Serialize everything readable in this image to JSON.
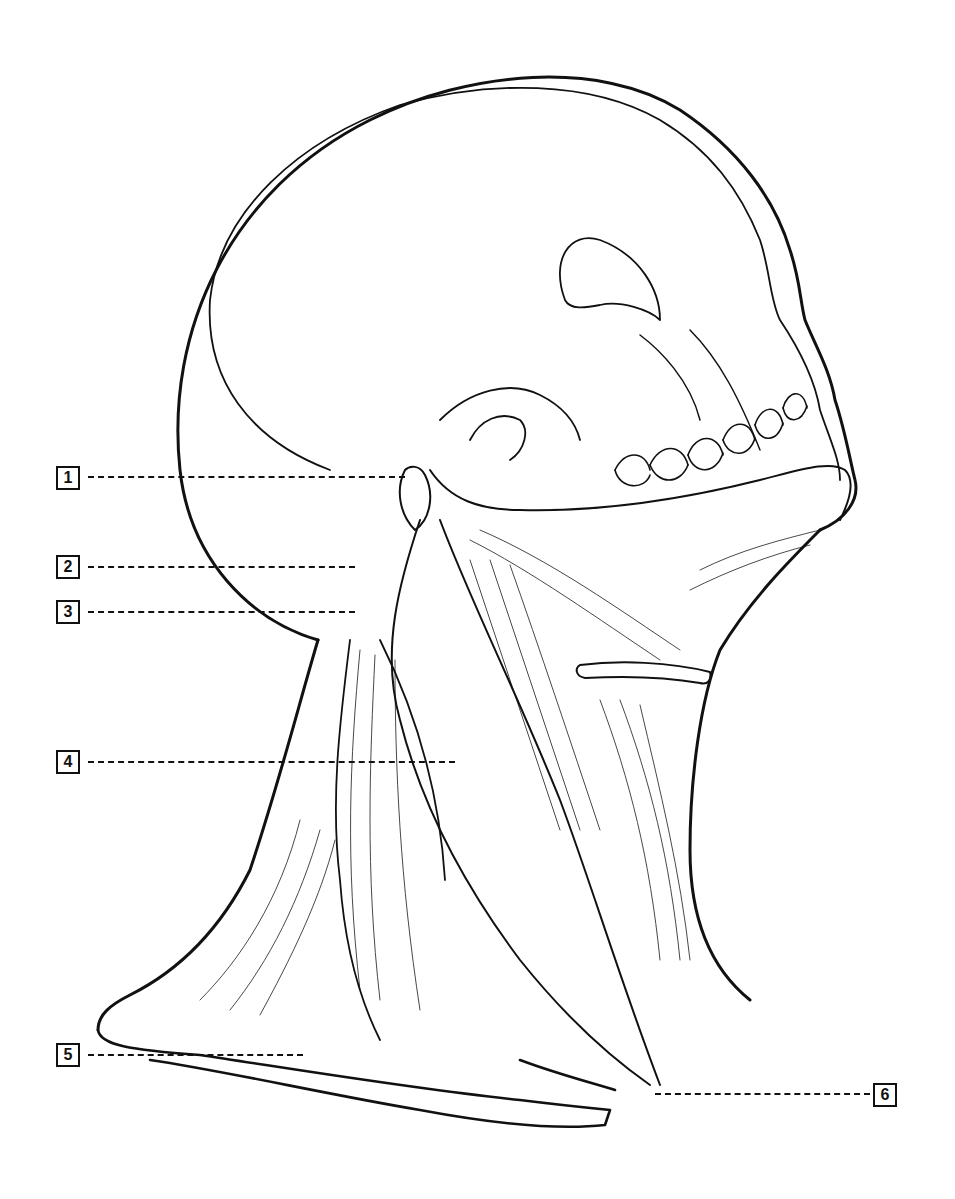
{
  "diagram": {
    "labels": [
      {
        "id": "1",
        "text": "1",
        "box": [
          56,
          466
        ],
        "leader": [
          88,
          476,
          405,
          476
        ]
      },
      {
        "id": "2",
        "text": "2",
        "box": [
          56,
          555
        ],
        "leader": [
          88,
          566,
          355,
          566
        ]
      },
      {
        "id": "3",
        "text": "3",
        "box": [
          56,
          600
        ],
        "leader": [
          88,
          611,
          355,
          611
        ]
      },
      {
        "id": "4",
        "text": "4",
        "box": [
          56,
          750
        ],
        "leader": [
          88,
          761,
          455,
          761
        ]
      },
      {
        "id": "5",
        "text": "5",
        "box": [
          56,
          1043
        ],
        "leader": [
          88,
          1054,
          303,
          1054
        ]
      },
      {
        "id": "6",
        "text": "6",
        "box": [
          873,
          1083
        ],
        "leader": [
          655,
          1093,
          870,
          1093
        ]
      }
    ]
  },
  "colors": {
    "line": "#111111",
    "background": "#ffffff"
  }
}
